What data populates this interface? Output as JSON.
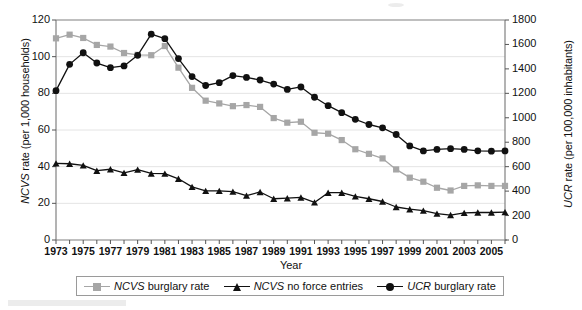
{
  "figure": {
    "background": "#ffffff",
    "plot_border_color": "#808080",
    "grid_color": "#e4e4e4"
  },
  "axes": {
    "x_title": "Year",
    "y_left_title_italic": "NCVS",
    "y_left_title_rest": " rate (per 1,000 households)",
    "y_right_title_italic": "UCR",
    "y_right_title_rest": " rate (per 100,000 inhabitants)",
    "y_left_ticks": [
      "0",
      "20",
      "40",
      "60",
      "80",
      "100",
      "120"
    ],
    "y_right_ticks": [
      "0",
      "200",
      "400",
      "600",
      "800",
      "1000",
      "1200",
      "1400",
      "1600",
      "1800"
    ],
    "x_ticks": [
      "1973",
      "1975",
      "1977",
      "1979",
      "1981",
      "1983",
      "1985",
      "1987",
      "1989",
      "1991",
      "1993",
      "1995",
      "1997",
      "1999",
      "2001",
      "2003",
      "2005"
    ]
  },
  "legend": {
    "items": [
      {
        "name": "ncvs-burglary-rate",
        "italic": "NCVS",
        "rest": " burglary rate",
        "marker": "square",
        "color": "#a6a6a6"
      },
      {
        "name": "ncvs-no-force-entries",
        "italic": "NCVS",
        "rest": " no force entries",
        "marker": "triangle",
        "color": "#111111"
      },
      {
        "name": "ucr-burglary-rate",
        "italic": "UCR",
        "rest": " burglary rate",
        "marker": "circle",
        "color": "#111111"
      }
    ]
  },
  "chart_data": {
    "type": "line",
    "title": "",
    "xlabel": "Year",
    "grid": true,
    "legend_position": "bottom",
    "x": [
      1973,
      1974,
      1975,
      1976,
      1977,
      1978,
      1979,
      1980,
      1981,
      1982,
      1983,
      1984,
      1985,
      1986,
      1987,
      1988,
      1989,
      1990,
      1991,
      1992,
      1993,
      1994,
      1995,
      1996,
      1997,
      1998,
      1999,
      2000,
      2001,
      2002,
      2003,
      2004,
      2005,
      2006
    ],
    "axes": {
      "left": {
        "label_italic": "NCVS",
        "label_rest": " rate (per 1,000 households)",
        "ylim": [
          0,
          120
        ],
        "tick_step": 20
      },
      "right": {
        "label_italic": "UCR",
        "label_rest": " rate (per 100,000 inhabitants)",
        "ylim": [
          0,
          1800
        ],
        "tick_step": 200
      },
      "xlim": [
        1973,
        2006
      ]
    },
    "series": [
      {
        "name": "NCVS burglary rate",
        "axis": "left",
        "marker": "square",
        "color": "#a6a6a6",
        "values": [
          110.0,
          112.0,
          110.2,
          106.4,
          105.5,
          102.0,
          101.0,
          100.8,
          105.8,
          94.0,
          83.0,
          76.0,
          74.5,
          73.0,
          73.6,
          72.6,
          66.5,
          64.0,
          64.5,
          58.5,
          58.0,
          54.5,
          49.5,
          47.0,
          44.5,
          38.5,
          34.0,
          31.8,
          28.5,
          27.0,
          29.5,
          29.8,
          29.5,
          29.5
        ]
      },
      {
        "name": "NCVS no force entries",
        "axis": "left",
        "marker": "triangle",
        "color": "#111111",
        "values": [
          41.8,
          41.6,
          40.7,
          37.8,
          38.6,
          36.6,
          38.4,
          36.3,
          36.2,
          33.4,
          29.0,
          26.8,
          26.8,
          26.4,
          24.2,
          26.2,
          22.5,
          22.8,
          23.2,
          20.5,
          25.8,
          25.8,
          23.8,
          22.5,
          21.0,
          18.0,
          16.8,
          16.0,
          14.4,
          13.6,
          14.8,
          15.0,
          15.0,
          15.2
        ]
      },
      {
        "name": "UCR burglary rate",
        "axis": "right",
        "marker": "circle",
        "color": "#111111",
        "values": [
          1222,
          1437,
          1532,
          1448,
          1410,
          1424,
          1511,
          1684,
          1647,
          1484,
          1337,
          1264,
          1287,
          1345,
          1330,
          1309,
          1276,
          1232,
          1252,
          1168,
          1099,
          1042,
          987,
          945,
          918,
          863,
          770,
          729,
          741,
          747,
          741,
          730,
          727,
          729
        ]
      }
    ]
  }
}
